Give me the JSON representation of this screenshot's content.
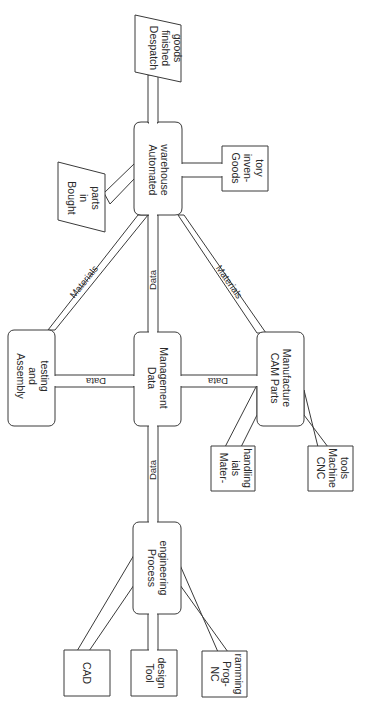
{
  "diagram": {
    "orientation": "rotated 90 degrees clockwise",
    "nodes": [
      {
        "id": "despatch",
        "label_lines": [
          "Despatch",
          "finished",
          "goods"
        ],
        "shape": "parallelogram"
      },
      {
        "id": "warehouse",
        "label_lines": [
          "Automated",
          "warehouse"
        ],
        "shape": "rounded-rect"
      },
      {
        "id": "goods_inventory",
        "label_lines": [
          "Goods",
          "inven-",
          "tory"
        ],
        "shape": "rect"
      },
      {
        "id": "bought_parts",
        "label_lines": [
          "Bought",
          "in",
          "parts"
        ],
        "shape": "parallelogram"
      },
      {
        "id": "assembly",
        "label_lines": [
          "Assembly",
          "and",
          "testing"
        ],
        "shape": "rounded-rect"
      },
      {
        "id": "data_mgmt",
        "label_lines": [
          "Data",
          "Management"
        ],
        "shape": "rounded-rect"
      },
      {
        "id": "cam",
        "label_lines": [
          "CAM Parts",
          "Manufacture"
        ],
        "shape": "rounded-rect"
      },
      {
        "id": "materials_handling",
        "label_lines": [
          "Mater-",
          "ials",
          "handling"
        ],
        "shape": "rect"
      },
      {
        "id": "cnc",
        "label_lines": [
          "CNC",
          "Machine",
          "tools"
        ],
        "shape": "rect"
      },
      {
        "id": "process_eng",
        "label_lines": [
          "Process",
          "engineering"
        ],
        "shape": "rounded-rect"
      },
      {
        "id": "cad",
        "label_lines": [
          "CAD"
        ],
        "shape": "rect"
      },
      {
        "id": "tool_design",
        "label_lines": [
          "Tool",
          "design"
        ],
        "shape": "rect"
      },
      {
        "id": "nc_prog",
        "label_lines": [
          "NC",
          "Prog-",
          "ramming"
        ],
        "shape": "rect"
      }
    ],
    "edges": [
      {
        "from": "warehouse",
        "to": "despatch",
        "label": ""
      },
      {
        "from": "warehouse",
        "to": "goods_inventory",
        "label": ""
      },
      {
        "from": "bought_parts",
        "to": "warehouse",
        "label": ""
      },
      {
        "from": "warehouse",
        "to": "assembly",
        "label": "Materials"
      },
      {
        "from": "warehouse",
        "to": "data_mgmt",
        "label": "Data"
      },
      {
        "from": "warehouse",
        "to": "cam",
        "label": "Materials"
      },
      {
        "from": "data_mgmt",
        "to": "assembly",
        "label": "Data"
      },
      {
        "from": "data_mgmt",
        "to": "cam",
        "label": "Data"
      },
      {
        "from": "data_mgmt",
        "to": "process_eng",
        "label": "Data"
      },
      {
        "from": "cam",
        "to": "materials_handling",
        "label": ""
      },
      {
        "from": "cam",
        "to": "cnc",
        "label": ""
      },
      {
        "from": "process_eng",
        "to": "cad",
        "label": ""
      },
      {
        "from": "process_eng",
        "to": "tool_design",
        "label": ""
      },
      {
        "from": "process_eng",
        "to": "nc_prog",
        "label": ""
      }
    ],
    "edge_labels": {
      "materials_left": "Materials",
      "materials_right": "Materials",
      "data_top": "Data",
      "data_left": "Data",
      "data_right": "Data",
      "data_bottom": "Data"
    },
    "colors": {
      "stroke": "#3a3a3a",
      "text": "#2a2a2a",
      "background": "#ffffff"
    }
  }
}
